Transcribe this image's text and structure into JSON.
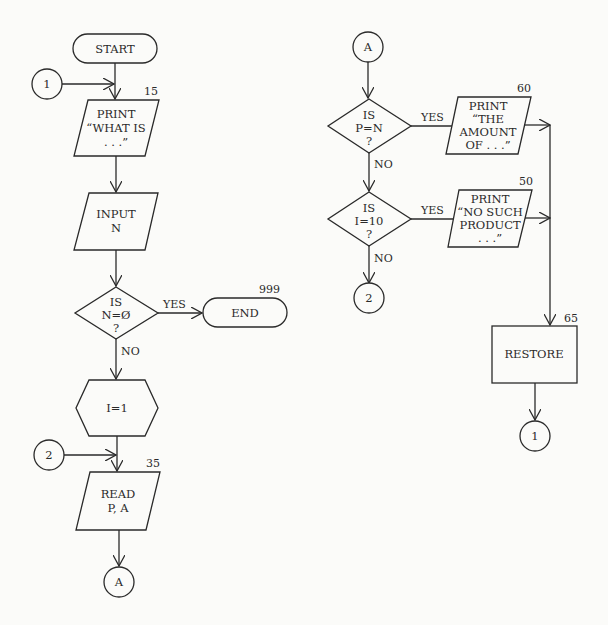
{
  "diagram": {
    "type": "flowchart",
    "left_column": {
      "start": {
        "label": "START"
      },
      "connector_1_in": {
        "label": "1"
      },
      "print_what_is": {
        "lines": [
          "PRINT",
          "“WHAT IS",
          ". . .”"
        ],
        "line_number": "15"
      },
      "input_n": {
        "lines": [
          "INPUT",
          "N"
        ]
      },
      "decision_n_zero": {
        "lines": [
          "IS",
          "N=Ø",
          "?"
        ],
        "yes_label": "YES",
        "no_label": "NO"
      },
      "end": {
        "label": "END",
        "line_number": "999"
      },
      "init_i": {
        "label": "I=1"
      },
      "connector_2_in": {
        "label": "2"
      },
      "read_pa": {
        "lines": [
          "READ",
          "P, A"
        ],
        "line_number": "35"
      },
      "connector_a_out": {
        "label": "A"
      }
    },
    "right_column": {
      "connector_a_in": {
        "label": "A"
      },
      "decision_p_eq_n": {
        "lines": [
          "IS",
          "P=N",
          "?"
        ],
        "yes_label": "YES",
        "no_label": "NO"
      },
      "print_amount": {
        "lines": [
          "PRINT",
          "“THE",
          "AMOUNT",
          "OF . . .”"
        ],
        "line_number": "60"
      },
      "decision_i_eq_10": {
        "lines": [
          "IS",
          "I=10",
          "?"
        ],
        "yes_label": "YES",
        "no_label": "NO"
      },
      "print_no_such": {
        "lines": [
          "PRINT",
          "“NO SUCH",
          "PRODUCT",
          ". . .”"
        ],
        "line_number": "50"
      },
      "connector_2_out": {
        "label": "2"
      },
      "restore": {
        "label": "RESTORE",
        "line_number": "65"
      },
      "connector_1_out": {
        "label": "1"
      }
    }
  }
}
